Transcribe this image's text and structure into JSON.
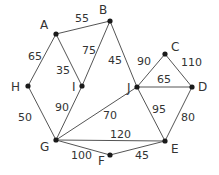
{
  "graph": {
    "type": "weighted-undirected-graph",
    "nodes": [
      {
        "id": "A",
        "x": 56,
        "y": 34,
        "lx": 40,
        "ly": 29
      },
      {
        "id": "B",
        "x": 110,
        "y": 21,
        "lx": 99,
        "ly": 14
      },
      {
        "id": "C",
        "x": 165,
        "y": 54,
        "lx": 171,
        "ly": 51
      },
      {
        "id": "D",
        "x": 192,
        "y": 87,
        "lx": 198,
        "ly": 91
      },
      {
        "id": "E",
        "x": 165,
        "y": 141,
        "lx": 171,
        "ly": 153
      },
      {
        "id": "F",
        "x": 110,
        "y": 155,
        "lx": 98,
        "ly": 165
      },
      {
        "id": "G",
        "x": 56,
        "y": 140,
        "lx": 40,
        "ly": 151
      },
      {
        "id": "H",
        "x": 28,
        "y": 86,
        "lx": 11,
        "ly": 91
      },
      {
        "id": "I",
        "x": 82,
        "y": 86,
        "lx": 72,
        "ly": 91
      },
      {
        "id": "J",
        "x": 137,
        "y": 87,
        "lx": 127,
        "ly": 92
      }
    ],
    "edges": [
      {
        "from": "A",
        "to": "B",
        "weight": "55",
        "lx": 75,
        "ly": 22
      },
      {
        "from": "A",
        "to": "H",
        "weight": "65",
        "lx": 28,
        "ly": 60
      },
      {
        "from": "A",
        "to": "I",
        "weight": "35",
        "lx": 56,
        "ly": 74
      },
      {
        "from": "B",
        "to": "I",
        "weight": "75",
        "lx": 82,
        "ly": 54
      },
      {
        "from": "B",
        "to": "J",
        "weight": "45",
        "lx": 108,
        "ly": 64
      },
      {
        "from": "C",
        "to": "J",
        "weight": "90",
        "lx": 137,
        "ly": 65
      },
      {
        "from": "C",
        "to": "D",
        "weight": "110",
        "lx": 181,
        "ly": 66
      },
      {
        "from": "J",
        "to": "D",
        "weight": "65",
        "lx": 157,
        "ly": 83
      },
      {
        "from": "J",
        "to": "E",
        "weight": "95",
        "lx": 152,
        "ly": 113
      },
      {
        "from": "D",
        "to": "E",
        "weight": "80",
        "lx": 181,
        "ly": 121
      },
      {
        "from": "H",
        "to": "G",
        "weight": "50",
        "lx": 18,
        "ly": 121
      },
      {
        "from": "I",
        "to": "G",
        "weight": "90",
        "lx": 55,
        "ly": 111
      },
      {
        "from": "G",
        "to": "J",
        "weight": "70",
        "lx": 103,
        "ly": 119
      },
      {
        "from": "G",
        "to": "E",
        "weight": "120",
        "lx": 110,
        "ly": 138
      },
      {
        "from": "G",
        "to": "F",
        "weight": "100",
        "lx": 71,
        "ly": 159
      },
      {
        "from": "F",
        "to": "E",
        "weight": "45",
        "lx": 135,
        "ly": 159
      }
    ]
  }
}
